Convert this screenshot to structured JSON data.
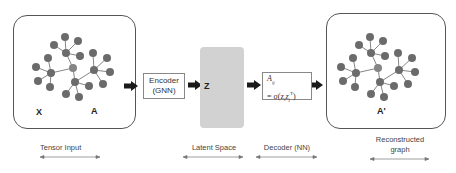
{
  "input_panel": {
    "label_x": "X",
    "label_a": "A"
  },
  "encoder": {
    "line1": "Encoder",
    "line2": "(GNN)"
  },
  "latent": {
    "label": "Z",
    "color": "#d2d2d2"
  },
  "decoder": {
    "line1": "A",
    "sub1": "ij",
    "line2": "= σ(z",
    "sub2": "i",
    "mid": "z",
    "sub3": "j",
    "sup3": "T",
    "end": ")"
  },
  "output_panel": {
    "label": "A'"
  },
  "captions": {
    "tensor_input": "Tensor Input",
    "latent_space": "Latent Space",
    "decoder_nn": "Decoder (NN)",
    "reconstructed_line1": "Reconstructed",
    "reconstructed_line2": "graph"
  },
  "colors": {
    "node": "#6b6b6b",
    "edge": "#777777",
    "arrow": "#1a1a1a"
  }
}
